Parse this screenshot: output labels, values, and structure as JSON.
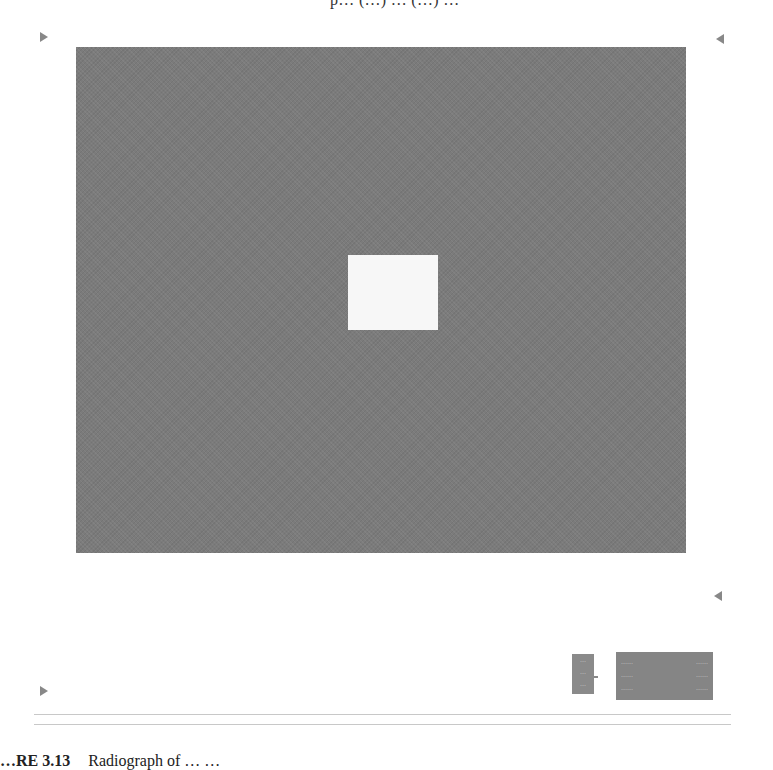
{
  "figure": {
    "top_caption_fragment": "p… (…) … (…) …",
    "field_color": "#7b7b7b",
    "center_square_color": "#f7f7f7",
    "legend_small": {
      "lines": [
        "…",
        "…",
        "…"
      ]
    },
    "legend_box": {
      "rows": [
        [
          "……",
          "……"
        ],
        [
          "……",
          "……"
        ],
        [
          "……",
          "……"
        ]
      ]
    },
    "bottom_caption": {
      "label": "…RE 3.13",
      "text": "Radiograph of … …"
    }
  }
}
